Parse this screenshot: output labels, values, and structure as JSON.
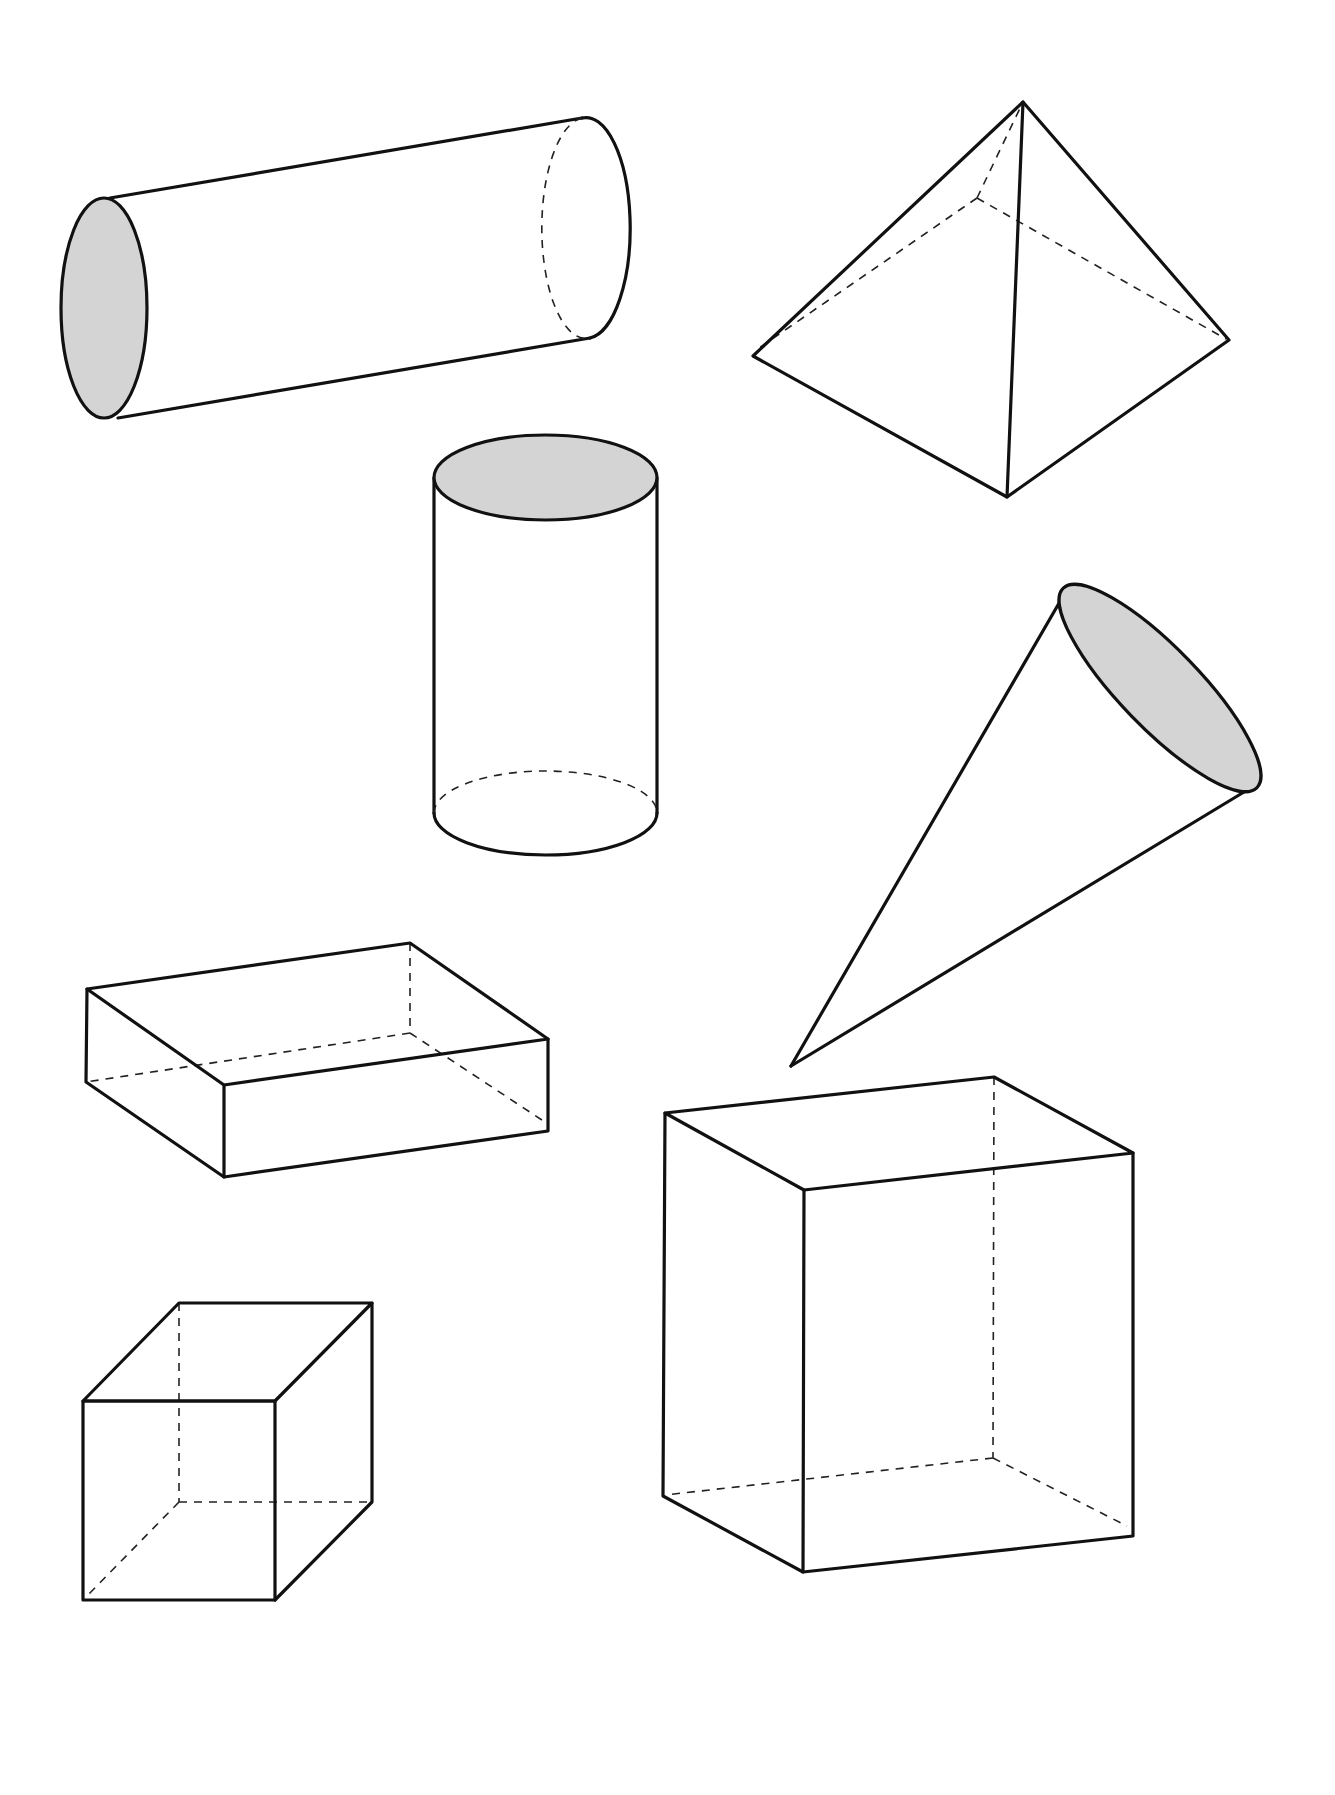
{
  "diagram": {
    "title": "",
    "colors": {
      "stroke": "#111111",
      "shaded_face": "#d4d4d4",
      "background": "#ffffff"
    },
    "shapes": [
      {
        "id": "horizontal-cylinder",
        "label": "Cylinder (lying on its side)",
        "shaded_face": "left base"
      },
      {
        "id": "square-pyramid",
        "label": "Square pyramid",
        "shaded_face": "none"
      },
      {
        "id": "vertical-cylinder",
        "label": "Cylinder (upright)",
        "shaded_face": "top base"
      },
      {
        "id": "cone",
        "label": "Cone",
        "shaded_face": "base"
      },
      {
        "id": "flat-rectangular-prism",
        "label": "Rectangular prism (flat)",
        "shaded_face": "none"
      },
      {
        "id": "cube",
        "label": "Cube",
        "shaded_face": "none"
      },
      {
        "id": "tall-rectangular-prism",
        "label": "Rectangular prism (tall)",
        "shaded_face": "none"
      }
    ]
  }
}
